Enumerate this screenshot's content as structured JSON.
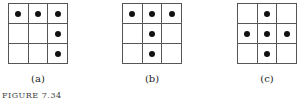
{
  "figure": {
    "caption": "FIGURE 7.34",
    "panels": [
      {
        "label": "(a)",
        "dots": [
          [
            1,
            1,
            1
          ],
          [
            0,
            0,
            1
          ],
          [
            0,
            0,
            1
          ]
        ]
      },
      {
        "label": "(b)",
        "dots": [
          [
            1,
            1,
            1
          ],
          [
            0,
            1,
            0
          ],
          [
            0,
            1,
            0
          ]
        ]
      },
      {
        "label": "(c)",
        "dots": [
          [
            0,
            1,
            0
          ],
          [
            1,
            1,
            1
          ],
          [
            0,
            1,
            0
          ]
        ]
      }
    ]
  }
}
